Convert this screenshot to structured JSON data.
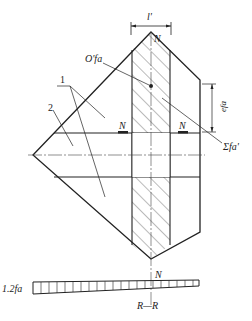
{
  "diagram": {
    "labels": {
      "top_dimension": "l'",
      "top_load": "N",
      "centroid": "O'fa",
      "callout_1": "1",
      "callout_2": "2",
      "left_load": "N",
      "right_load": "N",
      "eccentricity": "efa",
      "sum_force": "Σfa'",
      "bottom_load": "N",
      "stress_value": "1.2fa",
      "section": "R—R"
    },
    "colors": {
      "line": "#222222",
      "hatch": "#555555",
      "background": "#ffffff"
    }
  }
}
